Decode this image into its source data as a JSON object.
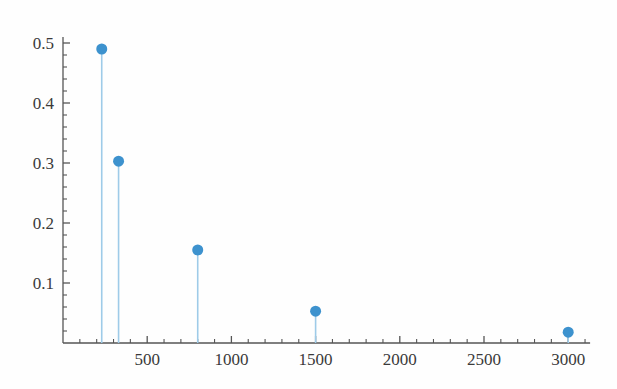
{
  "chart_data": {
    "type": "scatter",
    "plot_style": "stem",
    "title": "",
    "subtitle": "",
    "xlabel": "",
    "ylabel": "",
    "x": [
      230,
      330,
      800,
      1500,
      3000
    ],
    "values": [
      0.49,
      0.303,
      0.155,
      0.053,
      0.018
    ],
    "series": [
      {
        "name": "",
        "points": [
          {
            "x": 230,
            "y": 0.49
          },
          {
            "x": 330,
            "y": 0.303
          },
          {
            "x": 800,
            "y": 0.155
          },
          {
            "x": 1500,
            "y": 0.053
          },
          {
            "x": 3000,
            "y": 0.018
          }
        ]
      }
    ],
    "xlim": [
      0,
      3130
    ],
    "ylim": [
      0,
      0.51
    ],
    "xticks": [
      500,
      1000,
      1500,
      2000,
      2500,
      3000
    ],
    "xtick_labels": [
      "500",
      "1000",
      "1500",
      "2000",
      "2500",
      "3000"
    ],
    "yticks": [
      0.1,
      0.2,
      0.3,
      0.4,
      0.5
    ],
    "ytick_labels": [
      "0.1",
      "0.2",
      "0.3",
      "0.4",
      "0.5"
    ],
    "x_minor_tick_interval": 100,
    "y_minor_tick_interval": 0.02,
    "grid": false,
    "legend": null,
    "annotations": [],
    "colors": {
      "marker": "#3d92ce",
      "stem": "#9ecbe8",
      "axis": "#555555",
      "tick_label": "#3a3a3a",
      "background": "#fefefe"
    },
    "marker_radius_px": 5.5,
    "stem_width_px": 1.6
  },
  "axes": {
    "y_axis_name": "probability-axis",
    "x_axis_name": "value-axis"
  }
}
